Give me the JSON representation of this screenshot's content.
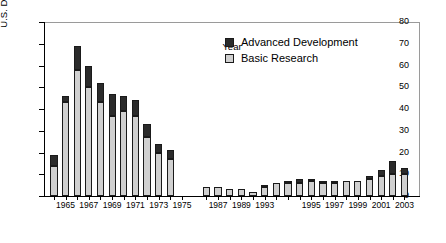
{
  "chart_data": {
    "type": "bar",
    "subtype": "stacked-vertical",
    "title": "",
    "xlabel": "Year",
    "ylabel": "U.S. Dollars (millions)",
    "ylim": [
      0,
      80
    ],
    "ytick_step": 10,
    "yticks": [
      0,
      10,
      20,
      30,
      40,
      50,
      60,
      70,
      80
    ],
    "grid": false,
    "legend_position": "upper-right-inside",
    "axis_break": true,
    "axis_break_note": "gap on x-axis between 1975 and 1986",
    "categories": [
      "1964",
      "1965",
      "1966",
      "1967",
      "1968",
      "1969",
      "1970",
      "1971",
      "1972",
      "1973",
      "1974",
      "1975",
      "1986",
      "1987",
      "1988",
      "1989",
      "1990",
      "1991",
      "1992",
      "1993",
      "1994",
      "1995",
      "1996",
      "1997",
      "1998",
      "1999",
      "2000",
      "2001",
      "2002",
      "2003"
    ],
    "series": [
      {
        "name": "Basic Research",
        "color": "#d0d0d0",
        "values": [
          14,
          43,
          58,
          50,
          43,
          37,
          39,
          37,
          27,
          20,
          17,
          0,
          4,
          4,
          3,
          3,
          2,
          4,
          6,
          6,
          6,
          7,
          6,
          6,
          7,
          7,
          8,
          9,
          10,
          10
        ]
      },
      {
        "name": "Advanced Development",
        "color": "#2b2b2b",
        "values": [
          5,
          3,
          11,
          10,
          9,
          10,
          7,
          7,
          6,
          4,
          4,
          0,
          0,
          0,
          0,
          0,
          0,
          1,
          0,
          1,
          2,
          1,
          1,
          1,
          0,
          0,
          1,
          3,
          6,
          3
        ]
      }
    ],
    "totals": [
      19,
      46,
      69,
      60,
      52,
      47,
      46,
      44,
      33,
      24,
      21,
      0,
      4,
      4,
      3,
      3,
      2,
      5,
      6,
      7,
      8,
      8,
      7,
      7,
      7,
      7,
      9,
      12,
      16,
      13
    ],
    "xtick_labels": [
      {
        "category": "1965",
        "label": "1965"
      },
      {
        "category": "1967",
        "label": "1967"
      },
      {
        "category": "1969",
        "label": "1969"
      },
      {
        "category": "1971",
        "label": "1971"
      },
      {
        "category": "1973",
        "label": "1973"
      },
      {
        "category": "1975",
        "label": "1975"
      },
      {
        "category": "1987",
        "label": "1987"
      },
      {
        "category": "1989",
        "label": "1989"
      },
      {
        "category": "1991",
        "label": "1993"
      },
      {
        "category": "1995",
        "label": "1995"
      },
      {
        "category": "1997",
        "label": "1997"
      },
      {
        "category": "1999",
        "label": "1999"
      },
      {
        "category": "2001",
        "label": "2001"
      },
      {
        "category": "2003",
        "label": "2003"
      }
    ]
  },
  "legend": {
    "items": [
      {
        "label": "Advanced Development",
        "color": "#2b2b2b"
      },
      {
        "label": "Basic Research",
        "color": "#d0d0d0"
      }
    ]
  }
}
